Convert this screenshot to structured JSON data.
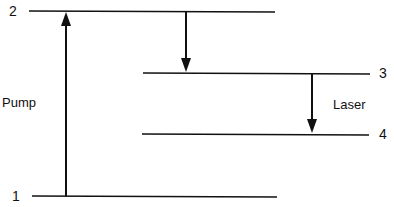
{
  "diagram": {
    "type": "energy-level-diagram",
    "levels": [
      {
        "label": "1",
        "y": 196,
        "x1": 32,
        "x2": 277
      },
      {
        "label": "2",
        "y": 11,
        "x1": 29,
        "x2": 275
      },
      {
        "label": "3",
        "y": 73,
        "x1": 143,
        "x2": 370
      },
      {
        "label": "4",
        "y": 134,
        "x1": 142,
        "x2": 369
      }
    ],
    "transitions": [
      {
        "name": "Pump",
        "from": "1",
        "to": "2"
      },
      {
        "name": "",
        "from": "2",
        "to": "3"
      },
      {
        "name": "Laser",
        "from": "3",
        "to": "4"
      }
    ],
    "labels": {
      "level1": "1",
      "level2": "2",
      "level3": "3",
      "level4": "4",
      "pump": "Pump",
      "laser": "Laser"
    },
    "line_color": "#111111"
  }
}
